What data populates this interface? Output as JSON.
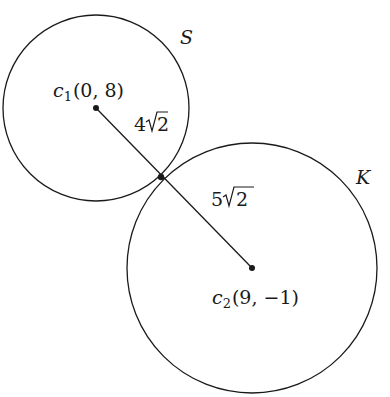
{
  "diagram": {
    "type": "tangent-circles",
    "colors": {
      "stroke": "#1a1a1a",
      "background": "#ffffff"
    },
    "circles": [
      {
        "name": "S",
        "label": "S",
        "cx": 96,
        "cy": 108,
        "r": 93
      },
      {
        "name": "K",
        "label": "K",
        "cx": 252,
        "cy": 268,
        "r": 125
      }
    ],
    "centers": [
      {
        "symbol": "c",
        "subscript": "1",
        "coords": "(0, 8)",
        "x": 96,
        "y": 108
      },
      {
        "symbol": "c",
        "subscript": "2",
        "coords": "(9, −1)",
        "x": 252,
        "y": 268
      }
    ],
    "tangent_point": {
      "x": 161,
      "y": 177
    },
    "segment_labels": [
      {
        "coef": "4",
        "radicand": "2",
        "text": "4√2"
      },
      {
        "coef": "5",
        "radicand": "2",
        "text": "5√2"
      }
    ]
  }
}
